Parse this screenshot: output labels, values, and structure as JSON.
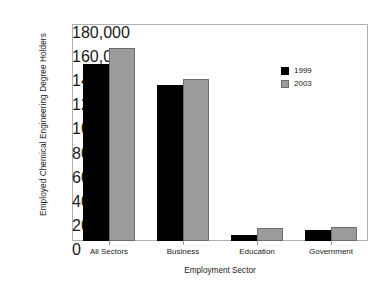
{
  "chart_data": {
    "type": "bar",
    "title": "",
    "subtitle": "",
    "xlabel": "Employment Sector",
    "ylabel": "Employed Chemical Engineering Degree Holders",
    "categories": [
      "All Sectors",
      "Business",
      "Education",
      "Government"
    ],
    "series": [
      {
        "name": "1999",
        "color": "#000000",
        "values": [
          147000,
          129000,
          5000,
          9000
        ]
      },
      {
        "name": "2003",
        "color": "#9b9b9b",
        "values": [
          160000,
          134000,
          11000,
          12000
        ]
      }
    ],
    "ylim": [
      0,
      180000
    ],
    "yticks": [
      0,
      20000,
      40000,
      60000,
      80000,
      100000,
      120000,
      140000,
      160000,
      180000
    ],
    "ytick_labels": [
      "0",
      "20,000",
      "40,000",
      "60,000",
      "80,000",
      "100,000",
      "120,000",
      "140,000",
      "160,000",
      "180,000"
    ],
    "grid": false,
    "legend_position": "inside-top-right",
    "legend_entries": [
      "1999",
      "2003"
    ],
    "annotations": []
  },
  "colors": {
    "series_1999": "#000000",
    "series_2003": "#9b9b9b",
    "frame": "#b0b0b0",
    "text": "#1a1a1a",
    "background": "#ffffff"
  }
}
